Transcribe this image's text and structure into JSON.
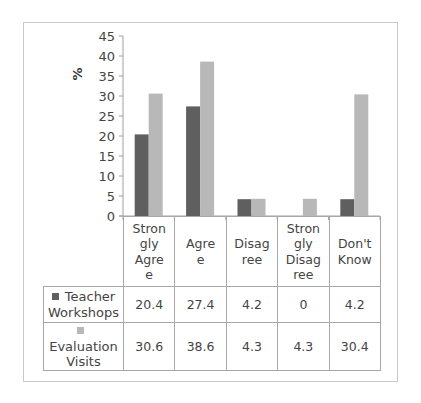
{
  "chart_data": {
    "type": "bar",
    "title": "",
    "xlabel": "",
    "ylabel": "%",
    "ylim": [
      0,
      45
    ],
    "yticks": [
      0,
      5,
      10,
      15,
      20,
      25,
      30,
      35,
      40,
      45
    ],
    "grid": false,
    "legend_position": "data-table",
    "categories": [
      "Strongly Agree",
      "Agree",
      "Disagree",
      "Strongly Disagree",
      "Don't Know"
    ],
    "category_labels_wrapped": [
      [
        "Stron",
        "gly",
        "Agre",
        "e"
      ],
      [
        "Agre",
        "e"
      ],
      [
        "Disag",
        "ree"
      ],
      [
        "Stron",
        "gly",
        "Disag",
        "ree"
      ],
      [
        "Don't",
        "Know"
      ]
    ],
    "series": [
      {
        "name": "Teacher Workshops",
        "name_lines": [
          "Teacher",
          "Workshops"
        ],
        "color": "#5f5f5f",
        "values": [
          20.4,
          27.4,
          4.2,
          0,
          4.2
        ],
        "labels": [
          "20.4",
          "27.4",
          "4.2",
          "0",
          "4.2"
        ]
      },
      {
        "name": "Evaluation Visits",
        "name_lines": [
          "Evaluation",
          "Visits"
        ],
        "color": "#b8b8b8",
        "values": [
          30.6,
          38.6,
          4.3,
          4.3,
          30.4
        ],
        "labels": [
          "30.6",
          "38.6",
          "4.3",
          "4.3",
          "30.4"
        ]
      }
    ]
  }
}
